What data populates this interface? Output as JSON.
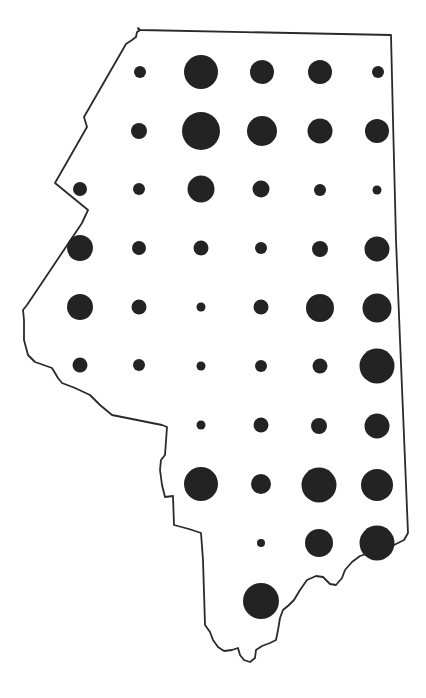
{
  "map": {
    "type": "proportional-symbol-map",
    "outline_color": "#2a2a2a",
    "symbol_color": "#232323",
    "background": "#ffffff",
    "outline_path": "M137,32 L139,31 L138,28 L140,30 L391,35 L393,120 L396,240 L400,340 L405,460 L408,533 L404,540 L398,543 L394,545 L385,550 L370,553 L360,556 L352,562 L345,570 L342,578 L336,585 L330,584 L323,577 L316,576 L307,580 L300,590 L294,600 L289,605 L283,610 L280,618 L278,630 L276,640 L270,643 L262,646 L256,650 L255,658 L250,662 L244,660 L240,655 L238,648 L232,650 L224,651 L218,647 L213,640 L210,632 L205,625 L203,560 L201,533 L189,529 L174,525 L173,496 L165,497 L162,485 L160,470 L161,460 L165,455 L167,427 L162,425 L112,415 L100,405 L90,395 L75,388 L62,383 L58,378 L52,368 L35,362 L28,355 L24,340 L24,320 L23,310 L27,305 L82,223 L88,210 L55,183 L87,127 L84,117 L126,44 L132,40 L136,37 Z",
    "symbols": [
      {
        "row": 1,
        "cx": 140,
        "cy": 72,
        "r": 6
      },
      {
        "row": 1,
        "cx": 201,
        "cy": 72,
        "r": 17
      },
      {
        "row": 1,
        "cx": 262,
        "cy": 72,
        "r": 12
      },
      {
        "row": 1,
        "cx": 320,
        "cy": 72,
        "r": 12
      },
      {
        "row": 1,
        "cx": 378,
        "cy": 72,
        "r": 6
      },
      {
        "row": 2,
        "cx": 139,
        "cy": 131,
        "r": 8
      },
      {
        "row": 2,
        "cx": 201,
        "cy": 131,
        "r": 19
      },
      {
        "row": 2,
        "cx": 262,
        "cy": 131,
        "r": 15
      },
      {
        "row": 2,
        "cx": 320,
        "cy": 131,
        "r": 12.5
      },
      {
        "row": 2,
        "cx": 377,
        "cy": 131,
        "r": 12
      },
      {
        "row": 3,
        "cx": 80,
        "cy": 189,
        "r": 7
      },
      {
        "row": 3,
        "cx": 139,
        "cy": 189,
        "r": 6
      },
      {
        "row": 3,
        "cx": 201,
        "cy": 189,
        "r": 13.5
      },
      {
        "row": 3,
        "cx": 261,
        "cy": 189,
        "r": 8.5
      },
      {
        "row": 3,
        "cx": 320,
        "cy": 190,
        "r": 6
      },
      {
        "row": 3,
        "cx": 377,
        "cy": 190,
        "r": 4.5
      },
      {
        "row": 4,
        "cx": 80,
        "cy": 248,
        "r": 13
      },
      {
        "row": 4,
        "cx": 139,
        "cy": 248,
        "r": 7
      },
      {
        "row": 4,
        "cx": 201,
        "cy": 248,
        "r": 7.5
      },
      {
        "row": 4,
        "cx": 261,
        "cy": 248,
        "r": 6
      },
      {
        "row": 4,
        "cx": 320,
        "cy": 249,
        "r": 8
      },
      {
        "row": 4,
        "cx": 377,
        "cy": 249,
        "r": 12.5
      },
      {
        "row": 5,
        "cx": 80,
        "cy": 307,
        "r": 13
      },
      {
        "row": 5,
        "cx": 139,
        "cy": 307,
        "r": 7.5
      },
      {
        "row": 5,
        "cx": 201,
        "cy": 307,
        "r": 4.5
      },
      {
        "row": 5,
        "cx": 261,
        "cy": 307,
        "r": 7.5
      },
      {
        "row": 5,
        "cx": 320,
        "cy": 308,
        "r": 14
      },
      {
        "row": 5,
        "cx": 377,
        "cy": 308,
        "r": 14.5
      },
      {
        "row": 6,
        "cx": 80,
        "cy": 365,
        "r": 7.5
      },
      {
        "row": 6,
        "cx": 139,
        "cy": 365,
        "r": 6
      },
      {
        "row": 6,
        "cx": 201,
        "cy": 366,
        "r": 4.5
      },
      {
        "row": 6,
        "cx": 261,
        "cy": 366,
        "r": 6
      },
      {
        "row": 6,
        "cx": 320,
        "cy": 366,
        "r": 7.5
      },
      {
        "row": 6,
        "cx": 377,
        "cy": 366,
        "r": 17.5
      },
      {
        "row": 7,
        "cx": 201,
        "cy": 425,
        "r": 4.5
      },
      {
        "row": 7,
        "cx": 261,
        "cy": 425,
        "r": 7.5
      },
      {
        "row": 7,
        "cx": 319,
        "cy": 426,
        "r": 8
      },
      {
        "row": 7,
        "cx": 377,
        "cy": 426,
        "r": 12.5
      },
      {
        "row": 8,
        "cx": 201,
        "cy": 484,
        "r": 17
      },
      {
        "row": 8,
        "cx": 261,
        "cy": 484,
        "r": 10
      },
      {
        "row": 8,
        "cx": 319,
        "cy": 485,
        "r": 17.5
      },
      {
        "row": 8,
        "cx": 377,
        "cy": 485,
        "r": 16
      },
      {
        "row": 9,
        "cx": 261,
        "cy": 543,
        "r": 4
      },
      {
        "row": 9,
        "cx": 319,
        "cy": 543,
        "r": 14
      },
      {
        "row": 9,
        "cx": 377,
        "cy": 543,
        "r": 17.5
      },
      {
        "row": 10,
        "cx": 261,
        "cy": 601,
        "r": 18
      }
    ]
  }
}
